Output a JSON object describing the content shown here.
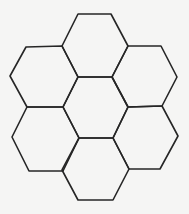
{
  "figure": {
    "background_color": "#f5f5f4",
    "stroke_color": "#262626",
    "stroke_width": 1.6,
    "hexagons": [
      {
        "name": "top",
        "points": "78,14 111,14 128,46 112,77 78,77 62,46"
      },
      {
        "name": "upper-left",
        "points": "26,47 62,46 78,77 63,107 27,107 10,76"
      },
      {
        "name": "upper-right",
        "points": "128,46 161,46 177,77 162,106 128,107 112,77"
      },
      {
        "name": "center",
        "points": "78,77 112,77 128,107 113,138 79,138 63,107"
      },
      {
        "name": "lower-left",
        "points": "27,107 63,107 79,138 63,171 29,171 12,137"
      },
      {
        "name": "lower-right",
        "points": "128,107 162,106 178,136 160,169 129,169 113,138"
      },
      {
        "name": "bottom",
        "points": "79,138 113,138 129,169 113,200 78,200 62,170"
      }
    ]
  }
}
